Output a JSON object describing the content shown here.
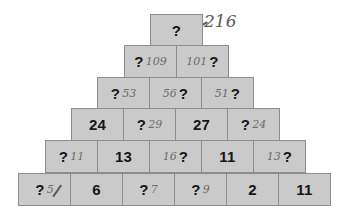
{
  "puzzle": {
    "type": "number-pyramid",
    "top_annotation": "216",
    "rows": [
      {
        "cells": [
          {
            "value": "?",
            "note": ""
          }
        ]
      },
      {
        "cells": [
          {
            "value": "?",
            "note": "109",
            "note_pos": "after"
          },
          {
            "value": "?",
            "note": "101",
            "note_pos": "before"
          }
        ]
      },
      {
        "cells": [
          {
            "value": "?",
            "note": "53",
            "note_pos": "after"
          },
          {
            "value": "?",
            "note": "56",
            "note_pos": "before"
          },
          {
            "value": "?",
            "note": "51",
            "note_pos": "before"
          }
        ]
      },
      {
        "cells": [
          {
            "value": "24",
            "note": ""
          },
          {
            "value": "?",
            "note": "29",
            "note_pos": "after"
          },
          {
            "value": "27",
            "note": ""
          },
          {
            "value": "?",
            "note": "24",
            "note_pos": "after"
          }
        ]
      },
      {
        "cells": [
          {
            "value": "?",
            "note": "11",
            "note_pos": "after"
          },
          {
            "value": "13",
            "note": ""
          },
          {
            "value": "?",
            "note": "16",
            "note_pos": "before"
          },
          {
            "value": "11",
            "note": ""
          },
          {
            "value": "?",
            "note": "13",
            "note_pos": "before"
          }
        ]
      },
      {
        "cells": [
          {
            "value": "?",
            "note": "5",
            "note_pos": "after"
          },
          {
            "value": "6",
            "note": ""
          },
          {
            "value": "?",
            "note": "7",
            "note_pos": "after"
          },
          {
            "value": "?",
            "note": "9",
            "note_pos": "after"
          },
          {
            "value": "2",
            "note": ""
          },
          {
            "value": "11",
            "note": ""
          }
        ]
      }
    ]
  },
  "colors": {
    "cell_fill": "#cacaca",
    "cell_border": "#8c8c8c",
    "text": "#161616",
    "pencil": "#6b6b6b"
  }
}
